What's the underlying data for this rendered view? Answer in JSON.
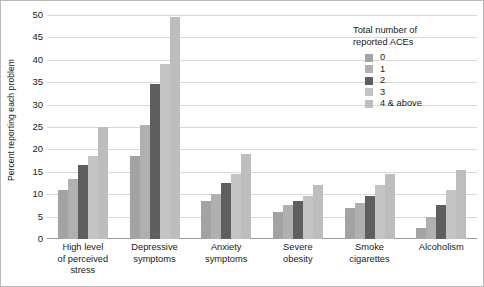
{
  "chart_data": {
    "type": "bar",
    "title": "",
    "xlabel": "",
    "ylabel": "Percent reporting each problem",
    "ylim": [
      0,
      50
    ],
    "ytick_values": [
      50,
      45,
      40,
      35,
      30,
      25,
      20,
      15,
      10,
      5,
      0
    ],
    "grid": true,
    "legend_position": "top-right",
    "legend_title": "Total number of\nreported ACEs",
    "categories": [
      "High level\nof perceived\nstress",
      "Depressive\nsymptoms",
      "Anxiety\nsymptoms",
      "Severe\nobesity",
      "Smoke\ncigarettes",
      "Alcoholism"
    ],
    "series": [
      {
        "name": "0",
        "color": "#a3a3a3",
        "values": [
          11.0,
          18.5,
          8.5,
          6.0,
          7.0,
          2.5
        ]
      },
      {
        "name": "1",
        "color": "#b0b0b0",
        "values": [
          13.5,
          25.5,
          10.0,
          7.5,
          8.0,
          5.0
        ]
      },
      {
        "name": "2",
        "color": "#5e5e5e",
        "values": [
          16.5,
          34.5,
          12.5,
          8.5,
          9.5,
          7.5
        ]
      },
      {
        "name": "3",
        "color": "#c4c4c4",
        "values": [
          18.5,
          39.0,
          14.5,
          9.5,
          12.0,
          11.0
        ]
      },
      {
        "name": "4 & above",
        "color": "#bdbdbd",
        "values": [
          25.0,
          49.5,
          19.0,
          12.0,
          14.5,
          15.5
        ]
      }
    ]
  },
  "colors": {
    "grid": "#d8d8d8",
    "axis": "#9a9a9a",
    "text": "#1a1a1a",
    "frame": "#b9b9b9"
  }
}
